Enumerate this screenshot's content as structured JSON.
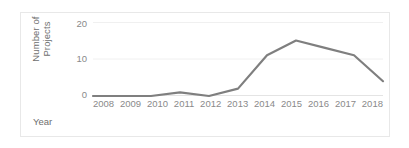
{
  "chart_data": {
    "type": "line",
    "title": "",
    "xlabel": "Year",
    "ylabel": "Number of Projects",
    "ylabel_line1": "Number of",
    "ylabel_line2": "Projects",
    "categories": [
      "2008",
      "2009",
      "2010",
      "2011",
      "2012",
      "2013",
      "2014",
      "2015",
      "2016",
      "2017",
      "2018"
    ],
    "values": [
      0,
      0,
      0,
      1,
      0,
      2,
      11,
      15,
      13,
      11,
      4
    ],
    "series": [
      {
        "name": "Number of Projects",
        "values": [
          0,
          0,
          0,
          1,
          0,
          2,
          11,
          15,
          13,
          11,
          4
        ]
      }
    ],
    "ylim": [
      0,
      20
    ],
    "y_ticks": [
      "20",
      "10",
      "0"
    ],
    "y_tick_values": [
      20,
      10,
      0
    ],
    "grid": true,
    "grid_axis": "y",
    "legend": false,
    "legend_position": "none",
    "line_color": "#7f7f7f",
    "grid_color": "#f0f0f0",
    "tick_label_color": "#8a8a8a",
    "axis_title_color": "#6e6e6e",
    "border_color": "#e8e8e8",
    "background_color": "#ffffff"
  }
}
